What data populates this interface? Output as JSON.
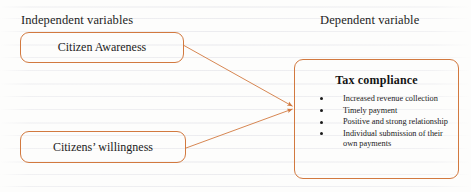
{
  "diagram": {
    "headers": {
      "independent": "Independent variables",
      "dependent": "Dependent variable"
    },
    "independent_boxes": [
      {
        "label": "Citizen Awareness"
      },
      {
        "label": "Citizens’ willingness"
      }
    ],
    "dependent_box": {
      "title": "Tax compliance",
      "items": [
        "Increased revenue collection",
        "Timely payment",
        "Positive and strong relationship",
        "Individual submission of their own payments"
      ]
    },
    "colors": {
      "box_border": "#d2793f",
      "arrow": "#d2793f",
      "text": "#1b1b1b",
      "background": "#fdfdfc"
    }
  }
}
